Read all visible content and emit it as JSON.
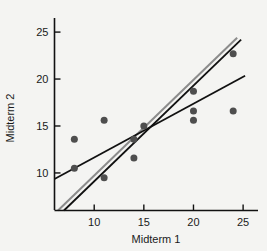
{
  "chart_data": {
    "type": "scatter",
    "title": "",
    "xlabel": "Midterm 1",
    "ylabel": "Midterm 2",
    "xlim": [
      6.0,
      26.5
    ],
    "ylim": [
      6.0,
      26.5
    ],
    "xticks": [
      10,
      15,
      20,
      25
    ],
    "yticks": [
      10,
      15,
      20,
      25
    ],
    "xtick_labels": [
      "10",
      "15",
      "20",
      "25"
    ],
    "ytick_labels": [
      "10",
      "15",
      "20",
      "25"
    ],
    "grid": false,
    "legend": "none",
    "marker_color": "#4e4e4e",
    "marker_size": 7,
    "background_color": "#f4f4f2",
    "axis_color": "#111111",
    "points": [
      {
        "x": 8.0,
        "y": 13.6
      },
      {
        "x": 8.0,
        "y": 10.5
      },
      {
        "x": 11.0,
        "y": 15.6
      },
      {
        "x": 11.0,
        "y": 9.5
      },
      {
        "x": 14.0,
        "y": 13.6
      },
      {
        "x": 14.0,
        "y": 11.6
      },
      {
        "x": 15.0,
        "y": 15.0
      },
      {
        "x": 20.0,
        "y": 18.7
      },
      {
        "x": 20.0,
        "y": 16.6
      },
      {
        "x": 20.0,
        "y": 15.6
      },
      {
        "x": 24.0,
        "y": 22.7
      },
      {
        "x": 24.0,
        "y": 16.6
      }
    ],
    "series": [
      {
        "name": "steep-gray-line",
        "type": "line",
        "color": "#8c8c8c",
        "width": 2.0,
        "x": [
          6.35,
          24.4
        ],
        "y": [
          6.0,
          24.4
        ]
      },
      {
        "name": "steep-black-line",
        "type": "line",
        "color": "#111111",
        "width": 1.8,
        "x": [
          6.95,
          24.8
        ],
        "y": [
          6.0,
          24.2
        ]
      },
      {
        "name": "regression-black-line",
        "type": "line",
        "color": "#111111",
        "width": 1.8,
        "x": [
          6.0,
          25.2
        ],
        "y": [
          9.35,
          20.35
        ]
      }
    ]
  },
  "axes": {
    "x_title": "Midterm 1",
    "y_title": "Midterm 2"
  }
}
